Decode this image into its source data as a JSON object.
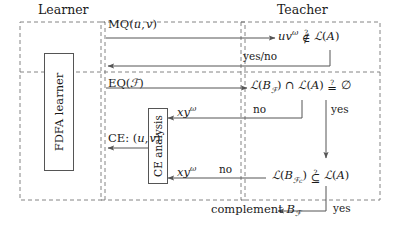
{
  "figure": {
    "title_learner": "Learner",
    "title_teacher": "Teacher"
  },
  "boxes": {
    "fdfa_learner": "FDFA learner",
    "ce_analysis": "CE analysis"
  },
  "messages": {
    "mq": "MQ(u, v)",
    "eq": "EQ(F)",
    "ce": "CE: (u, v)",
    "yes_no": "yes/no"
  },
  "queries": {
    "membership": "uvω ∉? L(A)",
    "emptiness": "L(B_F) ∩ L(A) =? ∅",
    "inclusion": "L(B_Fc) ⊆? L(A)"
  },
  "answers": {
    "yes_1": "yes",
    "yes_2": "yes",
    "no_1": "no",
    "no_2": "no"
  },
  "counterexamples": {
    "ce_1": "xyω",
    "ce_2": "xyω"
  },
  "actions": {
    "complement": "complement B_F"
  },
  "colors": {
    "line": "#555555",
    "dash": "#777777",
    "text": "#1a1a1a"
  }
}
